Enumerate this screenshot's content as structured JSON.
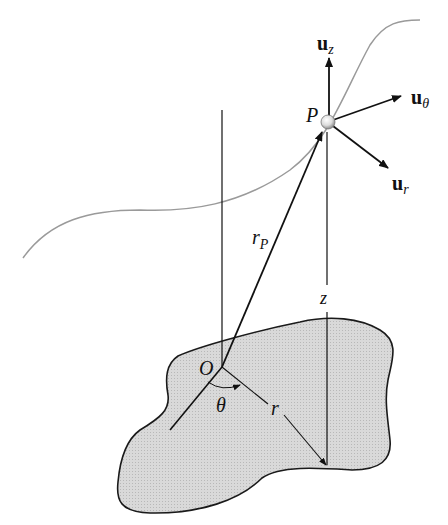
{
  "diagram": {
    "type": "cylindrical-coordinates",
    "colors": {
      "region_fill": "#d6d6d6",
      "region_stroke": "#1a1a1a",
      "path_curve": "#9a9a9a",
      "lines": "#111111",
      "particle": "#e8e8e8"
    },
    "labels": {
      "origin": "O",
      "point": "P",
      "position_vector": "r",
      "position_vector_sub": "P",
      "radial_distance": "r",
      "height": "z",
      "angle": "θ",
      "unit_z": "u",
      "unit_z_sub": "z",
      "unit_theta": "u",
      "unit_theta_sub": "θ",
      "unit_r": "u",
      "unit_r_sub": "r"
    }
  }
}
